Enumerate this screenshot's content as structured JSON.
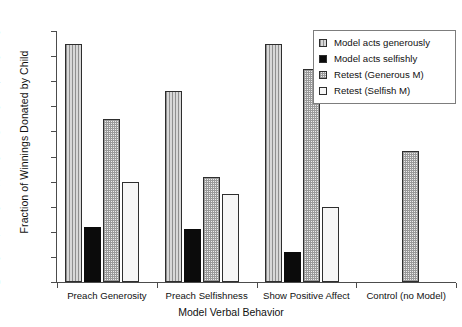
{
  "chart_data": {
    "type": "bar",
    "title": "",
    "xlabel": "Model Verbal Behavior",
    "ylabel": "Fraction of Winnings Donated by Child",
    "categories": [
      "Preach Generosity",
      "Preach Selfishness",
      "Show Positive Affect",
      "Control (no Model)"
    ],
    "series": [
      {
        "name": "Model acts generously",
        "values": [
          0.475,
          0.38,
          0.475,
          null
        ]
      },
      {
        "name": "Model acts selfishly",
        "values": [
          0.11,
          0.105,
          0.06,
          null
        ]
      },
      {
        "name": "Retest (Generous M)",
        "values": [
          0.325,
          0.21,
          0.425,
          0.26
        ]
      },
      {
        "name": "Retest (Selfish M)",
        "values": [
          0.2,
          0.175,
          0.15,
          null
        ]
      }
    ],
    "ylim": [
      0,
      0.5
    ],
    "yticks": [
      "0",
      "0.05",
      "0.1",
      "0.15",
      "0.2",
      "0.25",
      "0.3",
      "0.35",
      "0.4",
      "0.45",
      "0.5"
    ],
    "ytick_values": [
      0,
      0.05,
      0.1,
      0.15,
      0.2,
      0.25,
      0.3,
      0.35,
      0.4,
      0.45,
      0.5
    ],
    "grid": false,
    "legend_position": "top-right",
    "legend_entries": [
      {
        "label": "Model acts generously",
        "fill": "vertical-lines-grey"
      },
      {
        "label": "Model acts selfishly",
        "fill": "solid-black"
      },
      {
        "label": "Retest (Generous M)",
        "fill": "checker-dotted"
      },
      {
        "label": "Retest (Selfish M)",
        "fill": "white-empty"
      }
    ]
  }
}
